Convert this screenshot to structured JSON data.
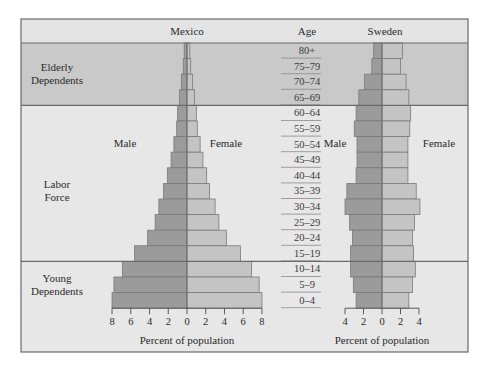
{
  "header": {
    "left_title": "Mexico",
    "center_title": "Age",
    "right_title": "Sweden"
  },
  "bands": [
    {
      "label_line1": "Elderly",
      "label_line2": "Dependents",
      "color": "#c9c9c9",
      "from_row": 0,
      "to_row": 3
    },
    {
      "label_line1": "Labor",
      "label_line2": "Force",
      "color": "#e7e7e7",
      "from_row": 4,
      "to_row": 13
    },
    {
      "label_line1": "Young",
      "label_line2": "Dependents",
      "color": "#e7e7e7",
      "from_row": 14,
      "to_row": 16
    }
  ],
  "legend": {
    "mexico_male": "Male",
    "mexico_female": "Female",
    "sweden_male": "Male",
    "sweden_female": "Female"
  },
  "axes": {
    "mexico_xlabel": "Percent of population",
    "sweden_xlabel": "Percent of population",
    "mexico_ticks": [
      "8",
      "6",
      "4",
      "2",
      "0",
      "2",
      "4",
      "6",
      "8"
    ],
    "sweden_ticks": [
      "4",
      "2",
      "0",
      "2",
      "4"
    ]
  },
  "colors": {
    "male": "#9b9b9b",
    "female": "#c4c4c4",
    "bar_stroke": "#7a7a7a",
    "frame": "#6a6a6a",
    "header_bg": "#e4e4e4"
  },
  "chart_data": [
    {
      "type": "bar",
      "subtype": "population-pyramid",
      "title": "Mexico",
      "xlabel": "Percent of population",
      "ylabel": "Age",
      "xlim": [
        -8,
        8
      ],
      "xticks": [
        -8,
        -6,
        -4,
        -2,
        0,
        2,
        4,
        6,
        8
      ],
      "grid": false,
      "categories": [
        "80+",
        "75–79",
        "70–74",
        "65–69",
        "60–64",
        "55–59",
        "50–54",
        "45–49",
        "40–44",
        "35–39",
        "30–34",
        "25–29",
        "20–24",
        "15–19",
        "10–14",
        "5–9",
        "0–4"
      ],
      "series": [
        {
          "name": "Male",
          "values": [
            0.3,
            0.4,
            0.6,
            0.8,
            1.0,
            1.1,
            1.4,
            1.7,
            2.1,
            2.5,
            3.0,
            3.4,
            4.2,
            5.6,
            6.9,
            7.8,
            8.0
          ]
        },
        {
          "name": "Female",
          "values": [
            0.3,
            0.4,
            0.6,
            0.8,
            1.0,
            1.1,
            1.4,
            1.7,
            2.1,
            2.4,
            3.0,
            3.4,
            4.2,
            5.7,
            6.9,
            7.7,
            8.0
          ]
        }
      ]
    },
    {
      "type": "bar",
      "subtype": "population-pyramid",
      "title": "Sweden",
      "xlabel": "Percent of population",
      "ylabel": "Age",
      "xlim": [
        -4,
        4
      ],
      "xticks": [
        -4,
        -2,
        0,
        2,
        4
      ],
      "grid": false,
      "categories": [
        "80+",
        "75–79",
        "70–74",
        "65–69",
        "60–64",
        "55–59",
        "50–54",
        "45–49",
        "40–44",
        "35–39",
        "30–34",
        "25–29",
        "20–24",
        "15–19",
        "10–14",
        "5–9",
        "0–4"
      ],
      "series": [
        {
          "name": "Male",
          "values": [
            0.9,
            1.1,
            1.9,
            2.5,
            2.8,
            3.0,
            2.7,
            2.7,
            2.8,
            3.8,
            4.0,
            3.5,
            3.2,
            3.4,
            3.4,
            3.1,
            2.8
          ]
        },
        {
          "name": "Female",
          "values": [
            2.2,
            2.0,
            2.6,
            2.9,
            3.1,
            3.0,
            2.8,
            2.8,
            2.8,
            3.7,
            4.1,
            3.5,
            3.3,
            3.4,
            3.6,
            3.3,
            2.9
          ]
        }
      ]
    }
  ]
}
